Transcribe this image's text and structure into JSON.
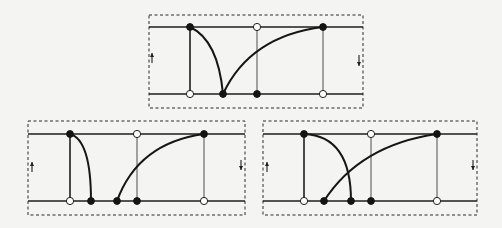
{
  "figure": {
    "type": "three-panel timing/edge diagram",
    "colors": {
      "ink": "#1e1e1e",
      "background": "#f4f4f2",
      "open_dot_fill": "#ffffff"
    },
    "panels": [
      {
        "id": "top",
        "frame": {
          "x": 149,
          "y": 15,
          "w": 214,
          "h": 93
        },
        "rails": {
          "top_y": 27,
          "bottom_y": 94,
          "x1": 149,
          "x2": 363
        },
        "arrows": [
          {
            "direction": "up",
            "x": 152,
            "y1": 63,
            "y2": 53
          },
          {
            "direction": "down",
            "x": 359,
            "y1": 55,
            "y2": 66
          }
        ],
        "verticals": [
          {
            "x": 190,
            "weight": "thick",
            "top_dot": "filled",
            "bottom_dot": "open"
          },
          {
            "x": 257,
            "weight": "thin",
            "top_dot": "open",
            "bottom_dot": "filled"
          },
          {
            "x": 323,
            "weight": "thin",
            "top_dot": "filled",
            "bottom_dot": "open"
          }
        ],
        "curves": [
          {
            "name": "falling-arc",
            "d": "M190,27 Q218,40 223,94"
          },
          {
            "name": "rising-arc",
            "d": "M223,94 Q250,36 323,27"
          }
        ],
        "extra_dots": [
          {
            "x": 223,
            "y": 94,
            "kind": "filled"
          }
        ]
      },
      {
        "id": "bottom-left",
        "frame": {
          "x": 28,
          "y": 121,
          "w": 217,
          "h": 94
        },
        "rails": {
          "top_y": 134,
          "bottom_y": 201,
          "x1": 28,
          "x2": 245
        },
        "arrows": [
          {
            "direction": "up",
            "x": 32,
            "y1": 172,
            "y2": 162
          },
          {
            "direction": "down",
            "x": 241,
            "y1": 160,
            "y2": 170
          }
        ],
        "verticals": [
          {
            "x": 70,
            "weight": "thick",
            "top_dot": "filled",
            "bottom_dot": "open"
          },
          {
            "x": 137,
            "weight": "thin",
            "top_dot": "open",
            "bottom_dot": "filled"
          },
          {
            "x": 204,
            "weight": "thin",
            "top_dot": "filled",
            "bottom_dot": "open"
          }
        ],
        "curves": [
          {
            "name": "falling-arc",
            "d": "M70,134 Q91,140 91,201"
          },
          {
            "name": "rising-arc",
            "d": "M117,201 Q138,143 204,134"
          }
        ],
        "extra_dots": [
          {
            "x": 91,
            "y": 201,
            "kind": "filled"
          },
          {
            "x": 117,
            "y": 201,
            "kind": "filled"
          }
        ]
      },
      {
        "id": "bottom-right",
        "frame": {
          "x": 263,
          "y": 121,
          "w": 214,
          "h": 94
        },
        "rails": {
          "top_y": 134,
          "bottom_y": 201,
          "x1": 263,
          "x2": 477
        },
        "arrows": [
          {
            "direction": "up",
            "x": 267,
            "y1": 172,
            "y2": 162
          },
          {
            "direction": "down",
            "x": 473,
            "y1": 160,
            "y2": 170
          }
        ],
        "verticals": [
          {
            "x": 304,
            "weight": "thick",
            "top_dot": "filled",
            "bottom_dot": "open"
          },
          {
            "x": 371,
            "weight": "thin",
            "top_dot": "open",
            "bottom_dot": "filled"
          },
          {
            "x": 437,
            "weight": "thin",
            "top_dot": "filled",
            "bottom_dot": "open"
          }
        ],
        "curves": [
          {
            "name": "falling-arc",
            "d": "M304,134 Q351,136 351,201"
          },
          {
            "name": "rising-arc",
            "d": "M324,201 Q360,145 437,134"
          }
        ],
        "extra_dots": [
          {
            "x": 351,
            "y": 201,
            "kind": "filled"
          },
          {
            "x": 324,
            "y": 201,
            "kind": "filled"
          }
        ]
      }
    ]
  }
}
